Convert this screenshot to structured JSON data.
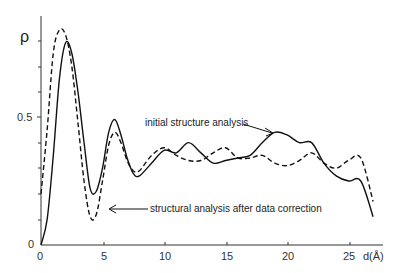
{
  "chart_data": {
    "type": "line",
    "title": "",
    "xlabel": "d(Å)",
    "ylabel": "ρ",
    "xlim": [
      0,
      27.5
    ],
    "ylim": [
      0,
      0.9
    ],
    "x_ticks": [
      "0",
      "5",
      "10",
      "15",
      "20",
      "25"
    ],
    "y_ticks": [
      "0",
      "0.5"
    ],
    "grid": false,
    "legend_position": "annotations",
    "series": [
      {
        "name": "initial structure analysis",
        "style": "solid",
        "x": [
          0,
          0.5,
          1,
          1.5,
          2,
          2.5,
          3,
          3.5,
          4,
          4.5,
          5,
          5.5,
          6,
          6.5,
          7,
          7.5,
          8,
          9,
          10,
          11,
          12,
          13,
          14,
          15,
          16,
          17,
          18,
          19,
          20,
          21,
          22,
          23,
          24,
          25,
          26,
          27
        ],
        "y": [
          0.0,
          0.1,
          0.35,
          0.65,
          0.79,
          0.75,
          0.6,
          0.4,
          0.22,
          0.21,
          0.3,
          0.44,
          0.49,
          0.43,
          0.34,
          0.28,
          0.27,
          0.32,
          0.37,
          0.36,
          0.4,
          0.36,
          0.32,
          0.33,
          0.34,
          0.35,
          0.4,
          0.44,
          0.43,
          0.4,
          0.4,
          0.32,
          0.27,
          0.25,
          0.25,
          0.11
        ]
      },
      {
        "name": "structural analysis after data correction",
        "style": "dashed",
        "x": [
          0,
          0.5,
          1,
          1.5,
          2,
          2.5,
          3,
          3.5,
          4,
          4.5,
          5,
          5.5,
          6,
          6.5,
          7,
          7.5,
          8,
          9,
          10,
          11,
          12,
          13,
          14,
          15,
          16,
          17,
          18,
          19,
          20,
          21,
          22,
          23,
          24,
          25,
          26,
          27
        ],
        "y": [
          0.2,
          0.45,
          0.75,
          0.84,
          0.82,
          0.7,
          0.48,
          0.25,
          0.11,
          0.12,
          0.25,
          0.39,
          0.44,
          0.4,
          0.33,
          0.29,
          0.29,
          0.35,
          0.38,
          0.35,
          0.33,
          0.33,
          0.36,
          0.38,
          0.34,
          0.34,
          0.35,
          0.32,
          0.31,
          0.33,
          0.36,
          0.32,
          0.3,
          0.33,
          0.34,
          0.17
        ]
      }
    ],
    "annotations": [
      "initial structure analysis",
      "structural analysis after data correction"
    ]
  },
  "labels": {
    "ylabel": "ρ",
    "xlabel": "d(Å)",
    "y0": "0",
    "y05": "0.5",
    "x0": "0",
    "x5": "5",
    "x10": "10",
    "x15": "15",
    "x20": "20",
    "x25": "25",
    "ann_initial": "initial structure analysis",
    "ann_corrected": "structural analysis after data correction"
  }
}
